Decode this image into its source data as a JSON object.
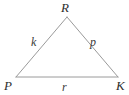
{
  "figure": {
    "type": "triangle-diagram",
    "background_color": "#ffffff",
    "stroke_color": "#9a9a9a",
    "stroke_width": 1,
    "label_color": "#3a3a3a",
    "vertex_label_color": "#2e2e2e",
    "vertices": [
      {
        "name": "R",
        "label": "R",
        "x": 67,
        "y": 17,
        "position": "apex"
      },
      {
        "name": "P",
        "label": "P",
        "x": 16,
        "y": 77,
        "position": "bottom-left"
      },
      {
        "name": "K",
        "label": "K",
        "x": 118,
        "y": 77,
        "position": "bottom-right"
      }
    ],
    "sides": [
      {
        "name": "PR",
        "label": "k",
        "from": "P",
        "to": "R",
        "position": "left"
      },
      {
        "name": "RK",
        "label": "p",
        "from": "R",
        "to": "K",
        "position": "right"
      },
      {
        "name": "PK",
        "label": "r",
        "from": "P",
        "to": "K",
        "position": "bottom"
      }
    ]
  }
}
